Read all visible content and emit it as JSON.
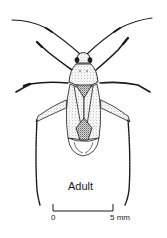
{
  "figure": {
    "caption": "Adult",
    "scale_bar": {
      "start_label": "0",
      "end_label": "5 mm"
    },
    "colors": {
      "ink": "#1a1a1a",
      "stipple": "#8a8a8a",
      "background": "#ffffff"
    }
  }
}
